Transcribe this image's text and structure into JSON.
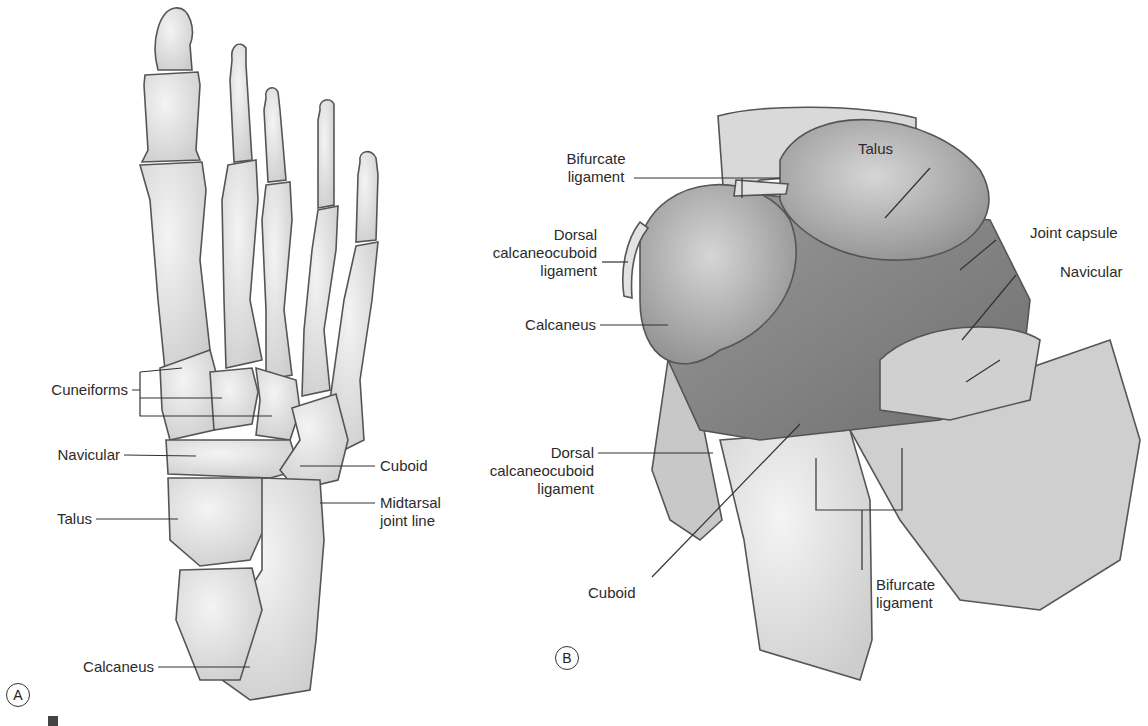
{
  "figure": {
    "panels": [
      {
        "id": "A",
        "letter": "A",
        "view": "dorsal view of foot skeleton",
        "labels": {
          "cuneiforms": "Cuneiforms",
          "navicular": "Navicular",
          "talus": "Talus",
          "calcaneus": "Calcaneus",
          "cuboid": "Cuboid",
          "midtarsal_1": "Midtarsal",
          "midtarsal_2": "joint line"
        }
      },
      {
        "id": "B",
        "letter": "B",
        "view": "midtarsal joint surfaces",
        "labels": {
          "bifurcate_top_1": "Bifurcate",
          "bifurcate_top_2": "ligament",
          "dorsal_cc_top_1": "Dorsal",
          "dorsal_cc_top_2": "calcaneocuboid",
          "dorsal_cc_top_3": "ligament",
          "calcaneus": "Calcaneus",
          "talus": "Talus",
          "joint_capsule": "Joint capsule",
          "navicular": "Navicular",
          "dorsal_cc_bottom_1": "Dorsal",
          "dorsal_cc_bottom_2": "calcaneocuboid",
          "dorsal_cc_bottom_3": "ligament",
          "cuboid": "Cuboid",
          "bifurcate_bottom_1": "Bifurcate",
          "bifurcate_bottom_2": "ligament"
        }
      }
    ],
    "colors": {
      "bone_light": "#e9e9e9",
      "bone_mid": "#cfcfcf",
      "outline": "#555555",
      "capsule_dark": "#8a8a8a",
      "leader": "#333333"
    }
  }
}
